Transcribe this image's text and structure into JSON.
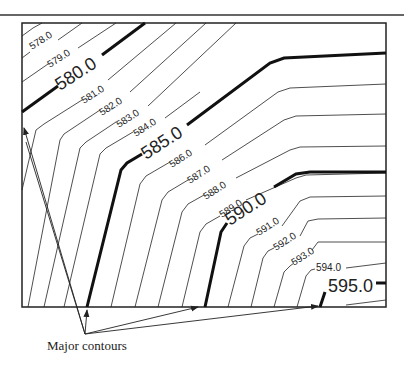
{
  "diagram": {
    "type": "contour-map",
    "caption": "Major contours",
    "contour_interval": 1.0,
    "major_interval": 5.0,
    "labels": {
      "c578": "578.0",
      "c579": "579.0",
      "c580": "580.0",
      "c581": "581.0",
      "c582": "582.0",
      "c583": "583.0",
      "c584": "584.0",
      "c585": "585.0",
      "c586": "586.0",
      "c587": "587.0",
      "c588": "588.0",
      "c589": "589.0",
      "c590": "590.0",
      "c591": "591.0",
      "c592": "592.0",
      "c593": "593.0",
      "c594": "594.0",
      "c595": "595.0"
    },
    "major_contours": [
      "580.0",
      "585.0",
      "590.0",
      "595.0"
    ],
    "colors": {
      "line": "#222222",
      "background": "#ffffff"
    }
  }
}
